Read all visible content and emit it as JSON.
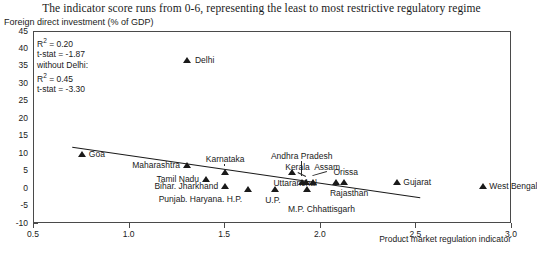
{
  "title": "The indicator score runs from 0-6, representing the least to most restrictive regulatory regime",
  "axis": {
    "ylabel": "Foreign direct investment (% of GDP)",
    "xlabel": "Product market regulation indicator",
    "yticks": [
      "45",
      "40",
      "35",
      "30",
      "25",
      "20",
      "15",
      "10",
      "5",
      "0",
      "-5",
      "-10"
    ],
    "xticks": [
      "0.5",
      "1.0",
      "1.5",
      "2.0",
      "2.5",
      "3.0"
    ]
  },
  "stats": {
    "r2_all_label": "R² = 0.20",
    "tstat_all_label": "t-stat = -1.87",
    "without_label": "without Delhi:",
    "r2_wo_label": "R² = 0.45",
    "tstat_wo_label": "t-stat = -3.30"
  },
  "chart_data": {
    "type": "scatter",
    "title": "The indicator score runs from 0-6, representing the least to most restrictive regulatory regime",
    "xlabel": "Product market regulation indicator",
    "ylabel": "Foreign direct investment (% of GDP)",
    "xlim": [
      0.5,
      3.0
    ],
    "ylim": [
      -10,
      45
    ],
    "xticks": [
      0.5,
      1.0,
      1.5,
      2.0,
      2.5,
      3.0
    ],
    "yticks": [
      -10,
      -5,
      0,
      5,
      10,
      15,
      20,
      25,
      30,
      35,
      40,
      45
    ],
    "grid": false,
    "legend": "none",
    "marker": "triangle",
    "marker_color": "#1a1a1a",
    "points": [
      {
        "label": "Delhi",
        "x": 1.3,
        "y": 37.0,
        "label_pos": "right"
      },
      {
        "label": "Goa",
        "x": 0.75,
        "y": 10.0,
        "label_pos": "right"
      },
      {
        "label": "Maharashtra",
        "x": 1.3,
        "y": 7.0,
        "label_pos": "left"
      },
      {
        "label": "Karnataka",
        "x": 1.5,
        "y": 5.0,
        "label_pos": "above"
      },
      {
        "label": "Tamil Nadu",
        "x": 1.4,
        "y": 3.0,
        "label_pos": "left"
      },
      {
        "label": "Bihar. Jharkhand",
        "x": 1.5,
        "y": 1.0,
        "label_pos": "left"
      },
      {
        "label": "Punjab. Haryana. H.P.",
        "x": 1.62,
        "y": 0.0,
        "label_pos": "below-left"
      },
      {
        "label": "U.P.",
        "x": 1.76,
        "y": 0.0,
        "label_pos": "below"
      },
      {
        "label": "Uttaranchal",
        "x": 1.85,
        "y": 5.0,
        "label_pos": "below"
      },
      {
        "label": "Andhra Pradesh",
        "x": 1.9,
        "y": 2.0,
        "label_pos": "above"
      },
      {
        "label": "Kerala",
        "x": 1.92,
        "y": 2.0,
        "label_pos": "above"
      },
      {
        "label": "Assam",
        "x": 1.96,
        "y": 2.0,
        "label_pos": "above"
      },
      {
        "label": "M.P. Chhattisgarh",
        "x": 1.93,
        "y": 0.0,
        "label_pos": "below"
      },
      {
        "label": "Rajasthan",
        "x": 2.08,
        "y": 2.0,
        "label_pos": "below"
      },
      {
        "label": "Orissa",
        "x": 2.12,
        "y": 2.0,
        "label_pos": "above"
      },
      {
        "label": "Gujarat",
        "x": 2.4,
        "y": 2.0,
        "label_pos": "right"
      },
      {
        "label": "West Bengal",
        "x": 2.85,
        "y": 1.0,
        "label_pos": "right"
      }
    ],
    "trendline": {
      "x0": 0.7,
      "y0": 12.0,
      "x1": 2.52,
      "y1": -2.5
    },
    "annotations": {
      "r2_all": 0.2,
      "t_stat_all": -1.87,
      "note": "without Delhi:",
      "r2_without_delhi": 0.45,
      "t_stat_without_delhi": -3.3
    }
  }
}
